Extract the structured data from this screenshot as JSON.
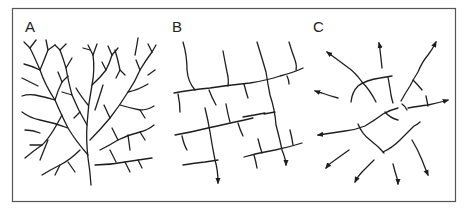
{
  "figure": {
    "panels": [
      {
        "id": "A",
        "label": "A",
        "pattern": "dendritic"
      },
      {
        "id": "B",
        "label": "B",
        "pattern": "trellis-rectangular"
      },
      {
        "id": "C",
        "label": "C",
        "pattern": "radial-centrifugal"
      }
    ],
    "colors": {
      "line": "#1e1e1e",
      "frame": "#555555",
      "background": "#ffffff"
    }
  }
}
